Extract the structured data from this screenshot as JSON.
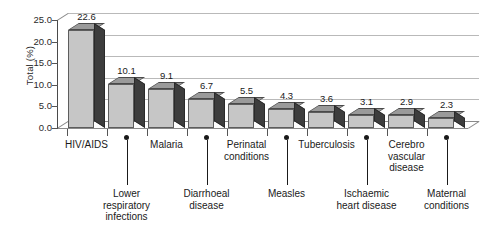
{
  "chart_data": {
    "type": "bar",
    "title": "",
    "subtitle": "",
    "xlabel": "",
    "ylabel": "Total (%)",
    "ylim": [
      0.0,
      25.0
    ],
    "ytick_labels": [
      "25.0",
      "20.0",
      "15.0",
      "10.0",
      "5.0",
      "0.0"
    ],
    "ytick_values": [
      25.0,
      20.0,
      15.0,
      10.0,
      5.0,
      0.0
    ],
    "grid": true,
    "grid_axis": "y",
    "legend": false,
    "legend_position": "none",
    "style": "3d-bar",
    "categories": [
      "HIV/AIDS",
      "Lower\nrespiratory\ninfections",
      "Malaria",
      "Diarrhoeal\ndisease",
      "Perinatal\nconditions",
      "Measles",
      "Tuberculosis",
      "Ischaemic\nheart disease",
      "Cerebro\nvascular\ndisease",
      "Maternal\nconditions"
    ],
    "values": [
      22.6,
      10.1,
      9.1,
      6.7,
      5.5,
      4.3,
      3.6,
      3.1,
      2.9,
      2.3
    ],
    "value_labels": [
      "22.6",
      "10.1",
      "9.1",
      "6.7",
      "5.5",
      "4.3",
      "3.6",
      "3.1",
      "2.9",
      "2.3"
    ],
    "label_rows": [
      "top",
      "bottom",
      "top",
      "bottom",
      "top",
      "bottom",
      "top",
      "bottom",
      "top",
      "bottom"
    ],
    "colors": {
      "bar_front": "#c6c6c6",
      "bar_side": "#3d3d3d",
      "bar_top": "#9a9a9a",
      "gridline": "#b9b9b9",
      "axis": "#4a4a4a",
      "text": "#1a1a1a",
      "background": "#ffffff"
    }
  }
}
